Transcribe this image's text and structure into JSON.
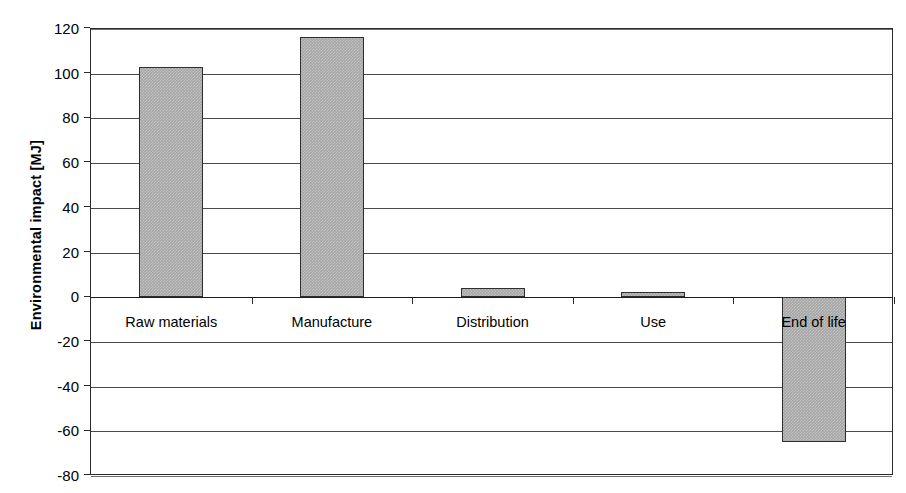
{
  "chart_data": {
    "type": "bar",
    "title": "",
    "xlabel": "",
    "ylabel": "Environmental impact [MJ]",
    "categories": [
      "Raw materials",
      "Manufacture",
      "Distribution",
      "Use",
      "End of life"
    ],
    "values": [
      103,
      116.5,
      4,
      2.5,
      -65
    ],
    "series": [
      {
        "name": "Environmental impact",
        "values": [
          103,
          116.5,
          4,
          2.5,
          -65
        ],
        "color": "#a6a6a6"
      }
    ],
    "ylim": [
      -80,
      120
    ],
    "ytick_step": 20,
    "yticks": [
      120,
      100,
      80,
      60,
      40,
      20,
      0,
      -20,
      -40,
      -60,
      -80
    ],
    "ytick_labels": [
      "120",
      "100",
      "80",
      "60",
      "40",
      "20",
      "0",
      "-20",
      "-40",
      "-60",
      "-80"
    ],
    "grid": true,
    "grid_axis": "y",
    "legend": false,
    "legend_position": "none",
    "bar_fill_color": "#a6a6a6",
    "bar_edge_color": "#2e2e2e",
    "axis_color": "#2b2b2b",
    "background_color": "#ffffff",
    "category_labels_position": "low"
  }
}
